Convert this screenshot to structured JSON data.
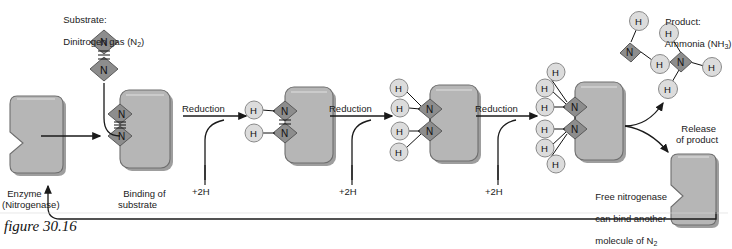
{
  "figure": {
    "caption": "figure 30.16"
  },
  "labels": {
    "substrate_line1": "Substrate:",
    "substrate_line2": "Dinitrogen gas (N",
    "substrate_sub": "2",
    "substrate_line2_end": ")",
    "enzyme_line1": "Enzyme",
    "enzyme_line2": "(Nitrogenase)",
    "binding_line1": "Binding of",
    "binding_line2": "substrate",
    "reduction": "Reduction",
    "plus2h": "+2H",
    "product_line1": "Product:",
    "product_line2": "Ammonia (NH",
    "product_sub": "3",
    "product_line2_end": ")",
    "release_line1": "Release",
    "release_line2": "of product",
    "free_line1": "Free nitrogenase",
    "free_line2": "can bind another",
    "free_line3": "molecule of N",
    "free_sub": "2"
  },
  "atoms": {
    "nitrogen": "N",
    "hydrogen": "H"
  },
  "colors": {
    "enzyme_fill": "#b6b6b6",
    "enzyme_edge": "#6e6e6e",
    "enzyme_highlight": "#cfcfcf",
    "nitrogen_fill": "#8d8d8d",
    "nitrogen_edge": "#5a5a5a",
    "hydrogen_fill": "#dcdcdc",
    "hydrogen_edge": "#8a8a8a",
    "line": "#1a1a1a",
    "background": "#ffffff"
  },
  "stages": [
    {
      "name": "free-enzyme",
      "hydrogens": 0,
      "bond": "none",
      "label": "Enzyme (Nitrogenase)"
    },
    {
      "name": "substrate-bound",
      "hydrogens": 0,
      "bond": "triple",
      "label": "Binding of substrate"
    },
    {
      "name": "first-reduction",
      "hydrogens": 2,
      "bond": "double",
      "label": "Reduction"
    },
    {
      "name": "second-reduction",
      "hydrogens": 4,
      "bond": "single",
      "label": "Reduction"
    },
    {
      "name": "third-reduction",
      "hydrogens": 6,
      "bond": "single",
      "label": "Reduction"
    }
  ],
  "products": [
    {
      "name": "ammonia-1",
      "formula": "NH3",
      "hydrogens": 3
    },
    {
      "name": "ammonia-2",
      "formula": "NH3",
      "hydrogens": 3
    }
  ]
}
